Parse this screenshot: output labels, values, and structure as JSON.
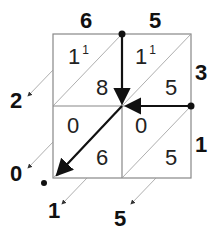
{
  "diagram": {
    "type": "lattice-multiplication",
    "top_digits": [
      "6",
      "5"
    ],
    "right_digits": [
      "3",
      "1"
    ],
    "cells": [
      {
        "row": 0,
        "col": 0,
        "upper": "1",
        "carry": "1",
        "lower": "8"
      },
      {
        "row": 0,
        "col": 1,
        "upper": "1",
        "carry": "1",
        "lower": "5"
      },
      {
        "row": 1,
        "col": 0,
        "upper": "0",
        "carry": "",
        "lower": "6"
      },
      {
        "row": 1,
        "col": 1,
        "upper": "0",
        "carry": "",
        "lower": "5"
      }
    ],
    "result_digits": [
      "2",
      "0",
      "1",
      "5"
    ],
    "colors": {
      "grid": "#888888",
      "ink": "#111111"
    }
  }
}
